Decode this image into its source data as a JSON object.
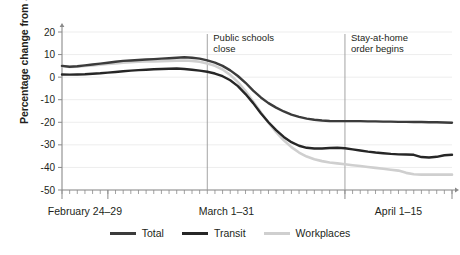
{
  "chart_data": {
    "type": "line",
    "title": "",
    "xlabel": "",
    "ylabel": "Percentage change from January 2020",
    "ylim": [
      -50,
      20
    ],
    "yticks": [
      20,
      10,
      0,
      -10,
      -20,
      -30,
      -40,
      -50
    ],
    "ytick_labels": [
      "20",
      "10",
      "0",
      "-10",
      "-20",
      "-30",
      "-40",
      "-50"
    ],
    "grid": true,
    "legend_position": "bottom",
    "x_group_labels": [
      "February 24–29",
      "March 1–31",
      "April 1–15"
    ],
    "x": [
      "Feb 24",
      "Feb 25",
      "Feb 26",
      "Feb 27",
      "Feb 28",
      "Feb 29",
      "Mar 1",
      "Mar 2",
      "Mar 3",
      "Mar 4",
      "Mar 5",
      "Mar 6",
      "Mar 7",
      "Mar 8",
      "Mar 9",
      "Mar 10",
      "Mar 11",
      "Mar 12",
      "Mar 13",
      "Mar 14",
      "Mar 15",
      "Mar 16",
      "Mar 17",
      "Mar 18",
      "Mar 19",
      "Mar 20",
      "Mar 21",
      "Mar 22",
      "Mar 23",
      "Mar 24",
      "Mar 25",
      "Mar 26",
      "Mar 27",
      "Mar 28",
      "Mar 29",
      "Mar 30",
      "Mar 31",
      "Apr 1",
      "Apr 2",
      "Apr 3",
      "Apr 4",
      "Apr 5",
      "Apr 6",
      "Apr 7",
      "Apr 8",
      "Apr 9",
      "Apr 10",
      "Apr 11",
      "Apr 12",
      "Apr 13",
      "Apr 14",
      "Apr 15"
    ],
    "series": [
      {
        "name": "Total",
        "color": "#3b3b3b",
        "values": [
          5,
          4.6,
          4.8,
          5.2,
          5.6,
          6,
          6.4,
          6.8,
          7.2,
          7.4,
          7.6,
          7.8,
          8,
          8.2,
          8.4,
          8.6,
          8.8,
          8.6,
          8.2,
          7.4,
          6.4,
          5,
          3,
          0.5,
          -2.5,
          -6,
          -9,
          -11.5,
          -13.5,
          -15.2,
          -16.6,
          -17.6,
          -18.4,
          -18.9,
          -19.2,
          -19.4,
          -19.5,
          -19.5,
          -19.5,
          -19.5,
          -19.6,
          -19.6,
          -19.7,
          -19.7,
          -19.8,
          -19.8,
          -19.9,
          -19.9,
          -20,
          -20,
          -20.1,
          -20.2
        ]
      },
      {
        "name": "Transit",
        "color": "#262626",
        "values": [
          1.2,
          1.1,
          1.2,
          1.3,
          1.5,
          1.7,
          2,
          2.3,
          2.6,
          2.9,
          3.1,
          3.3,
          3.5,
          3.6,
          3.7,
          3.8,
          3.6,
          3.3,
          2.9,
          2.4,
          1.6,
          0.4,
          -1.4,
          -4,
          -7.5,
          -11.5,
          -16,
          -20,
          -23.5,
          -26.5,
          -28.8,
          -30.4,
          -31.3,
          -31.6,
          -31.6,
          -31.4,
          -31.3,
          -31.5,
          -32,
          -32.5,
          -33,
          -33.4,
          -33.7,
          -34,
          -34.2,
          -34.3,
          -34.4,
          -35.4,
          -35.6,
          -35.3,
          -34.6,
          -34.4
        ]
      },
      {
        "name": "Workplaces",
        "color": "#cfcfcf",
        "values": [
          5,
          4.5,
          4.6,
          4.9,
          5.2,
          5.5,
          5.8,
          6.1,
          6.4,
          6.6,
          6.8,
          6.9,
          7,
          7.1,
          7.2,
          7.3,
          7.4,
          7.2,
          6.8,
          6,
          5,
          3.4,
          1,
          -2.2,
          -6.2,
          -10.8,
          -15.6,
          -20.2,
          -24.4,
          -28,
          -31,
          -33.4,
          -35.2,
          -36.4,
          -37.2,
          -37.8,
          -38.2,
          -38.6,
          -39,
          -39.4,
          -39.8,
          -40.2,
          -40.6,
          -41,
          -41.4,
          -42.4,
          -43,
          -43.2,
          -43.2,
          -43.2,
          -43.2,
          -43.2
        ]
      }
    ],
    "annotations": [
      {
        "label_line1": "Public schools",
        "label_line2": "close",
        "x_index": 19
      },
      {
        "label_line1": "Stay-at-home",
        "label_line2": "order begins",
        "x_index": 37
      }
    ]
  }
}
